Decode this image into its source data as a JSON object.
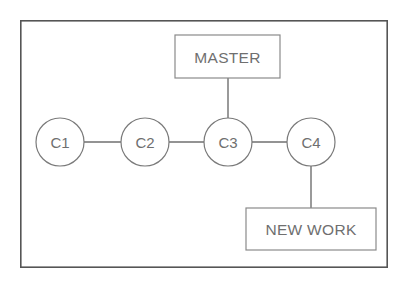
{
  "diagram": {
    "background_color": "#ffffff",
    "frame": {
      "x": 20,
      "y": 20,
      "width": 368,
      "height": 248,
      "stroke_color": "#555555"
    },
    "style": {
      "text_color": "#6f6f6f",
      "circle_stroke": "#7a7a7a",
      "box_stroke": "#8a8a8a",
      "edge_stroke": "#6f6f6f"
    },
    "commits": [
      {
        "id": "c1",
        "label": "C1",
        "cx": 60,
        "cy": 142,
        "r": 24
      },
      {
        "id": "c2",
        "label": "C2",
        "cx": 145,
        "cy": 142,
        "r": 24
      },
      {
        "id": "c3",
        "label": "C3",
        "cx": 228,
        "cy": 142,
        "r": 24
      },
      {
        "id": "c4",
        "label": "C4",
        "cx": 311,
        "cy": 142,
        "r": 24
      }
    ],
    "refs": [
      {
        "id": "master",
        "label": "MASTER",
        "x": 175,
        "y": 35,
        "width": 105,
        "height": 43,
        "points_to": "c3"
      },
      {
        "id": "new-work",
        "label": "NEW WORK",
        "x": 246,
        "y": 208,
        "width": 130,
        "height": 42,
        "points_to": "c4"
      }
    ],
    "edges": [
      {
        "id": "c1-c2",
        "x1": 84,
        "y1": 142,
        "x2": 121,
        "y2": 142
      },
      {
        "id": "c2-c3",
        "x1": 169,
        "y1": 142,
        "x2": 204,
        "y2": 142
      },
      {
        "id": "c3-c4",
        "x1": 252,
        "y1": 142,
        "x2": 287,
        "y2": 142
      },
      {
        "id": "master-c3",
        "x1": 228,
        "y1": 78,
        "x2": 228,
        "y2": 118
      },
      {
        "id": "c4-newwork",
        "x1": 311,
        "y1": 166,
        "x2": 311,
        "y2": 208
      }
    ]
  }
}
